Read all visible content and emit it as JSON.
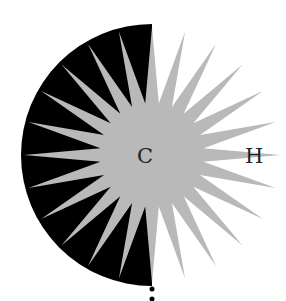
{
  "diagram": {
    "labels": {
      "center": "C",
      "right": "H"
    },
    "colors": {
      "half_disc": "#000000",
      "star": "#b9b9b9",
      "text": "#222222",
      "background": "#ffffff"
    },
    "star": {
      "spikes": 24,
      "center": [
        152,
        155
      ],
      "inner_radius": 52,
      "outer_radius": 128
    },
    "half_disc": {
      "center": [
        152,
        155
      ],
      "radius": 131,
      "side": "left"
    },
    "dots": 2
  }
}
